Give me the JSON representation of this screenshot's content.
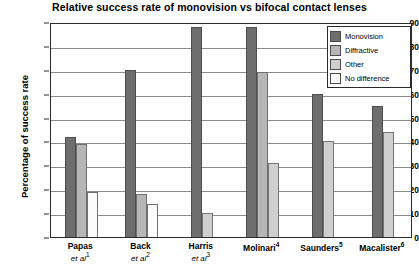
{
  "chart_data": {
    "type": "bar",
    "title": "Relative success rate of monovision vs bifocal contact lenses",
    "xlabel": "",
    "ylabel": "Percentage of success rate",
    "ylim": [
      0,
      90
    ],
    "yticks": [
      0,
      10,
      20,
      30,
      40,
      50,
      60,
      70,
      80,
      90
    ],
    "grid": true,
    "legend_position": "top-right",
    "categories": [
      "Papas et al1",
      "Back et al2",
      "Harris et al3",
      "Molinari4",
      "Saunders5",
      "Macalister6"
    ],
    "category_labels": [
      {
        "name": "Papas",
        "source": "et al",
        "ref": "1"
      },
      {
        "name": "Back",
        "source": "et al",
        "ref": "2"
      },
      {
        "name": "Harris",
        "source": "et al",
        "ref": "3"
      },
      {
        "name": "Molinari",
        "source": "",
        "ref": "4"
      },
      {
        "name": "Saunders",
        "source": "",
        "ref": "5"
      },
      {
        "name": "Macalister",
        "source": "",
        "ref": "6"
      }
    ],
    "series": [
      {
        "name": "Monovision",
        "color": "#6e6e6e",
        "values": [
          42,
          70,
          88,
          88,
          60,
          55
        ]
      },
      {
        "name": "Diffractive",
        "color": "#b6b6b6",
        "values": [
          39,
          18,
          null,
          69,
          null,
          null
        ]
      },
      {
        "name": "Other",
        "color": "#cfcfcf",
        "values": [
          null,
          null,
          10,
          31,
          40,
          44
        ]
      },
      {
        "name": "No difference",
        "color": "#fbfbfb",
        "values": [
          19,
          14,
          null,
          null,
          null,
          null
        ]
      }
    ]
  },
  "legend": {
    "items": [
      {
        "label": "Monovision",
        "key": "mono"
      },
      {
        "label": "Diffractive",
        "key": "diff"
      },
      {
        "label": "Other",
        "key": "other"
      },
      {
        "label": "No difference",
        "key": "nodiff"
      }
    ]
  }
}
